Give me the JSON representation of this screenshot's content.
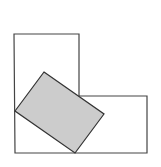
{
  "figure": {
    "width": 161,
    "height": 167,
    "background": "#ffffff",
    "l_shape": {
      "points": "14,34 79,34 79,96 147,96 147,153 15,153",
      "stroke": "#444444",
      "fill": "none",
      "stroke_width": 1.2
    },
    "tilted_rectangle": {
      "points": "44,72 104,114 75,153 15,111",
      "stroke": "#333333",
      "fill": "#cccccc",
      "stroke_width": 1.2
    }
  }
}
